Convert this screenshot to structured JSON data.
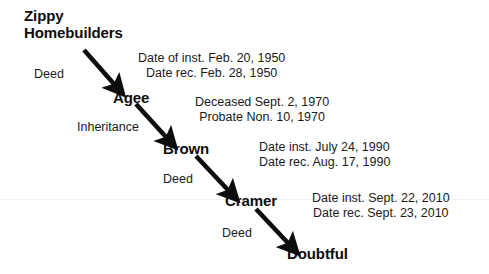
{
  "diagram": {
    "type": "chain-of-title-flow",
    "background_color": "#ffffff",
    "ink_color": "#111111"
  },
  "nodes": [
    {
      "id": "zippy",
      "label_line1": "Zippy",
      "label_line2": "Homebuilders",
      "x": 24,
      "y": 8
    },
    {
      "id": "agee",
      "label": "Agee",
      "x": 113,
      "y": 89
    },
    {
      "id": "brown",
      "label": "Brown",
      "x": 163,
      "y": 140
    },
    {
      "id": "cramer",
      "label": "Cramer",
      "x": 225,
      "y": 192
    },
    {
      "id": "doubtful",
      "label": "Doubtful",
      "x": 287,
      "y": 246
    }
  ],
  "edges": [
    {
      "id": "zippy-agee",
      "label": "Deed",
      "from": "zippy",
      "to": "agee",
      "label_x": 34,
      "label_y": 67
    },
    {
      "id": "agee-brown",
      "label": "Inheritance",
      "from": "agee",
      "to": "brown",
      "label_x": 77,
      "label_y": 120
    },
    {
      "id": "brown-cramer",
      "label": "Deed",
      "from": "brown",
      "to": "cramer",
      "label_x": 163,
      "label_y": 172
    },
    {
      "id": "cramer-doubtful",
      "label": "Deed",
      "from": "cramer",
      "to": "doubtful",
      "label_x": 222,
      "label_y": 226
    }
  ],
  "annotations": [
    {
      "id": "ann-zippy-agee",
      "for_edge": "zippy-agee",
      "line1": "Date of inst. Feb. 20, 1950",
      "line2": "Date rec. Feb. 28, 1950",
      "x": 138,
      "y": 52
    },
    {
      "id": "ann-agee-brown",
      "for_edge": "agee-brown",
      "line1": "Deceased Sept. 2, 1970",
      "line2": "Probate Non. 10, 1970",
      "x": 195,
      "y": 96
    },
    {
      "id": "ann-brown-cramer",
      "for_edge": "brown-cramer",
      "line1": "Date inst. July 24, 1990",
      "line2": "Date rec. Aug. 17, 1990",
      "x": 259,
      "y": 141
    },
    {
      "id": "ann-cramer-doubtful",
      "for_edge": "cramer-doubtful",
      "line1": "Date inst. Sept. 22, 2010",
      "line2": "Date rec. Sept. 23, 2010",
      "x": 312,
      "y": 192
    }
  ],
  "arrows": [
    {
      "id": "arrow-zippy-agee",
      "x1": 84,
      "y1": 50,
      "x2": 118,
      "y2": 89
    },
    {
      "id": "arrow-agee-brown",
      "x1": 136,
      "y1": 104,
      "x2": 170,
      "y2": 141
    },
    {
      "id": "arrow-brown-cramer",
      "x1": 196,
      "y1": 156,
      "x2": 232,
      "y2": 194
    },
    {
      "id": "arrow-cramer-doubtful",
      "x1": 256,
      "y1": 209,
      "x2": 292,
      "y2": 247
    }
  ]
}
